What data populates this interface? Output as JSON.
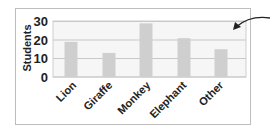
{
  "chart_data": {
    "type": "bar",
    "title": "",
    "xlabel": "",
    "ylabel": "Students",
    "categories": [
      "Lion",
      "Giraffe",
      "Monkey",
      "Elephant",
      "Other"
    ],
    "values": [
      19,
      13,
      29,
      21,
      15
    ],
    "ylim": [
      0,
      30
    ],
    "yticks": [
      0,
      10,
      20,
      30
    ],
    "grid": true,
    "bar_color": "#cfcfcf",
    "annotations": [
      {
        "type": "arrow",
        "description": "curved arrow pointing into top-right region of plot area (between 20 and 30)"
      }
    ]
  },
  "axis": {
    "ylabel": "Students",
    "yticks": [
      "30",
      "20",
      "10",
      "0"
    ]
  },
  "labels": [
    "Lion",
    "Giraffe",
    "Monkey",
    "Elephant",
    "Other"
  ]
}
